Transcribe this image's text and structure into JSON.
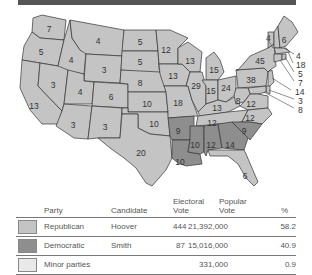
{
  "map": {
    "colors": {
      "republican": "#c4c4c4",
      "democratic": "#8e8e8e",
      "minor": "#e9e9e9",
      "border": "#333333"
    },
    "state_labels": [
      {
        "state": "WA",
        "ev": "7",
        "x": 49,
        "y": 21
      },
      {
        "state": "OR",
        "ev": "5",
        "x": 41,
        "y": 44
      },
      {
        "state": "CA",
        "ev": "13",
        "x": 34,
        "y": 98
      },
      {
        "state": "ID",
        "ev": "4",
        "x": 71,
        "y": 52
      },
      {
        "state": "NV",
        "ev": "3",
        "x": 53,
        "y": 77
      },
      {
        "state": "MT",
        "ev": "4",
        "x": 98,
        "y": 33
      },
      {
        "state": "WY",
        "ev": "3",
        "x": 104,
        "y": 62
      },
      {
        "state": "UT",
        "ev": "4",
        "x": 80,
        "y": 84
      },
      {
        "state": "CO",
        "ev": "6",
        "x": 111,
        "y": 89
      },
      {
        "state": "AZ",
        "ev": "3",
        "x": 73,
        "y": 117
      },
      {
        "state": "NM",
        "ev": "3",
        "x": 105,
        "y": 119
      },
      {
        "state": "ND",
        "ev": "5",
        "x": 140,
        "y": 34
      },
      {
        "state": "SD",
        "ev": "5",
        "x": 140,
        "y": 54
      },
      {
        "state": "NE",
        "ev": "8",
        "x": 140,
        "y": 75
      },
      {
        "state": "KS",
        "ev": "10",
        "x": 147,
        "y": 96
      },
      {
        "state": "OK",
        "ev": "10",
        "x": 154,
        "y": 116
      },
      {
        "state": "TX",
        "ev": "20",
        "x": 141,
        "y": 145
      },
      {
        "state": "MN",
        "ev": "12",
        "x": 166,
        "y": 42
      },
      {
        "state": "IA",
        "ev": "13",
        "x": 173,
        "y": 68
      },
      {
        "state": "MO",
        "ev": "18",
        "x": 178,
        "y": 95
      },
      {
        "state": "AR",
        "ev": "9",
        "x": 178,
        "y": 123
      },
      {
        "state": "LA",
        "ev": "10",
        "x": 180,
        "y": 154
      },
      {
        "state": "WI",
        "ev": "13",
        "x": 190,
        "y": 53
      },
      {
        "state": "IL",
        "ev": "29",
        "x": 196,
        "y": 78
      },
      {
        "state": "MI",
        "ev": "15",
        "x": 214,
        "y": 62
      },
      {
        "state": "IN",
        "ev": "15",
        "x": 211,
        "y": 83
      },
      {
        "state": "OH",
        "ev": "24",
        "x": 226,
        "y": 80
      },
      {
        "state": "KY",
        "ev": "13",
        "x": 217,
        "y": 100
      },
      {
        "state": "TN",
        "ev": "12",
        "x": 212,
        "y": 115
      },
      {
        "state": "MS",
        "ev": "10",
        "x": 195,
        "y": 137
      },
      {
        "state": "AL",
        "ev": "12",
        "x": 211,
        "y": 137
      },
      {
        "state": "GA",
        "ev": "14",
        "x": 230,
        "y": 137
      },
      {
        "state": "FL",
        "ev": "6",
        "x": 245,
        "y": 168
      },
      {
        "state": "SC",
        "ev": "9",
        "x": 244,
        "y": 123
      },
      {
        "state": "NC",
        "ev": "12",
        "x": 250,
        "y": 110
      },
      {
        "state": "VA",
        "ev": "12",
        "x": 251,
        "y": 96
      },
      {
        "state": "WV",
        "ev": "8",
        "x": 238,
        "y": 93
      },
      {
        "state": "PA",
        "ev": "38",
        "x": 251,
        "y": 72
      },
      {
        "state": "NY",
        "ev": "45",
        "x": 260,
        "y": 53
      },
      {
        "state": "ME",
        "ev": "6",
        "x": 284,
        "y": 32
      }
    ],
    "callouts": [
      {
        "state": "VT",
        "ev": "4",
        "x": 266,
        "y": 30
      },
      {
        "state": "NH",
        "ev": "4",
        "x": 296,
        "y": 48
      },
      {
        "state": "MA",
        "ev": "18",
        "x": 296,
        "y": 57
      },
      {
        "state": "RI",
        "ev": "5",
        "x": 298,
        "y": 66
      },
      {
        "state": "CT",
        "ev": "7",
        "x": 298,
        "y": 75
      },
      {
        "state": "NJ",
        "ev": "14",
        "x": 295,
        "y": 84
      },
      {
        "state": "DE",
        "ev": "3",
        "x": 298,
        "y": 93
      },
      {
        "state": "MD",
        "ev": "8",
        "x": 298,
        "y": 102
      }
    ]
  },
  "legend": {
    "headers": {
      "party": "Party",
      "candidate": "Candidate",
      "electoral_line1": "Electoral",
      "electoral_line2": "Vote",
      "popular_line1": "Popular",
      "popular_line2": "Vote",
      "percent": "%"
    },
    "rows": [
      {
        "party": "Republican",
        "candidate": "Hoover",
        "electoral": "444",
        "popular": "21,392,000",
        "percent": "58.2",
        "color": "#c4c4c4"
      },
      {
        "party": "Democratic",
        "candidate": "Smith",
        "electoral": "87",
        "popular": "15,016,000",
        "percent": "40.9",
        "color": "#8e8e8e"
      },
      {
        "party": "Minor parties",
        "candidate": "",
        "electoral": "",
        "popular": "331,000",
        "percent": "0.9",
        "color": "#e9e9e9"
      }
    ]
  }
}
